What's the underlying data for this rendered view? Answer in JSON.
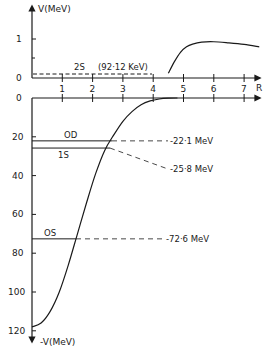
{
  "chart_data": {
    "type": "line",
    "title": "",
    "top_panel": {
      "ylabel": "V(MeV)",
      "y_ticks": [
        0,
        1
      ],
      "ylim": [
        0,
        1.5
      ],
      "xlabel": "R",
      "x_ticks": [
        1,
        2,
        3,
        4,
        5,
        6,
        7
      ],
      "xlim": [
        0,
        7.5
      ],
      "curve": {
        "name": "barrier",
        "x": [
          4.5,
          4.7,
          4.9,
          5.1,
          5.3,
          5.6,
          6.0,
          6.5,
          7.0,
          7.5
        ],
        "y": [
          0.12,
          0.42,
          0.66,
          0.8,
          0.87,
          0.92,
          0.93,
          0.9,
          0.86,
          0.8
        ]
      },
      "levels": [
        {
          "name": "2S",
          "energy_label": "(92·12 KeV)",
          "value_mev": 0.09212,
          "x_end": 4.5
        }
      ]
    },
    "bottom_panel": {
      "ylabel": "-V(MeV)",
      "y_ticks": [
        0,
        20,
        40,
        60,
        80,
        100,
        120
      ],
      "ylim": [
        0,
        125
      ],
      "inverted": true,
      "x_ticks": [
        1,
        2,
        3,
        4,
        5,
        6,
        7
      ],
      "xlim": [
        0,
        7.5
      ],
      "curve": {
        "name": "well",
        "x": [
          0.0,
          0.3,
          0.6,
          0.9,
          1.2,
          1.5,
          1.8,
          2.1,
          2.4,
          2.7,
          3.0,
          3.3,
          3.6,
          3.9,
          4.2,
          4.5,
          4.8
        ],
        "y": [
          118,
          116,
          110,
          100,
          86,
          70,
          54,
          39,
          27,
          19,
          12,
          7,
          3.5,
          1.5,
          0.5,
          0.1,
          0
        ]
      },
      "levels": [
        {
          "name": "OD",
          "value_mev": 22.1,
          "label": "-22·1  MeV"
        },
        {
          "name": "1S",
          "value_mev": 25.8,
          "label": "-25·8  MeV"
        },
        {
          "name": "OS",
          "value_mev": 72.6,
          "label": "-72·6  MeV"
        }
      ]
    }
  },
  "labels": {
    "top_ylabel": "V(MeV)",
    "bottom_ylabel": "-V(MeV)",
    "xlabel": "R",
    "top_tick_0": "0",
    "top_tick_1": "1",
    "bottom_tick_0": "0",
    "level_2s": "2S",
    "level_2s_energy": "(92·12 KeV)",
    "level_od": "OD",
    "level_1s": "1S",
    "level_os": "OS",
    "energy_od": "-22·1  MeV",
    "energy_1s": "-25·8  MeV",
    "energy_os": "-72·6  MeV"
  }
}
